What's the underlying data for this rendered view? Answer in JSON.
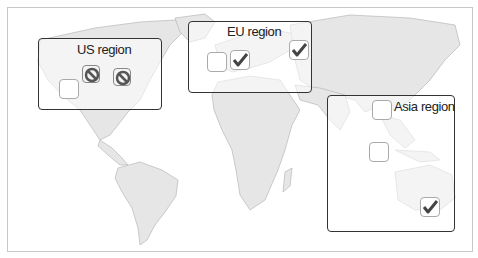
{
  "diagram": {
    "type": "world-map-region-status",
    "colors": {
      "land": "#e4e4e4",
      "land_stroke": "#b5b5b5",
      "region_border": "#333333",
      "checkbox_border": "#aaaaaa",
      "check": "#444444",
      "blocked": "#555555"
    },
    "regions": [
      {
        "id": "us",
        "title": "US region",
        "markers": [
          {
            "state": "empty"
          },
          {
            "state": "blocked"
          },
          {
            "state": "blocked"
          }
        ]
      },
      {
        "id": "eu",
        "title": "EU region",
        "markers": [
          {
            "state": "empty"
          },
          {
            "state": "checked"
          },
          {
            "state": "checked"
          }
        ]
      },
      {
        "id": "asia",
        "title": "Asia region",
        "markers": [
          {
            "state": "empty"
          },
          {
            "state": "empty"
          },
          {
            "state": "checked"
          }
        ]
      }
    ]
  }
}
